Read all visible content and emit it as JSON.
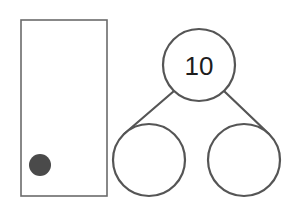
{
  "page": {
    "background_color": "#ffffff",
    "width": 300,
    "height": 211
  },
  "colors": {
    "rect_stroke": "#6b6b6b",
    "circle_stroke": "#555555",
    "dot_fill": "#4a4a4a",
    "text_fill": "#1d1d1d",
    "fill_white": "#ffffff"
  },
  "counter_frame": {
    "label": "counter-frame",
    "x": 21,
    "y": 20,
    "width": 86,
    "height": 176,
    "dots": [
      {
        "label": "counter-dot-1",
        "cx": 40,
        "cy": 165,
        "r": 11
      }
    ],
    "dot_count": "1"
  },
  "number_bond": {
    "label": "number-bond",
    "whole": {
      "label": "whole-circle",
      "value": "10",
      "cx": 199,
      "cy": 65,
      "r": 36
    },
    "parts": [
      {
        "label": "part-circle-left",
        "value": "",
        "cx": 149,
        "cy": 160,
        "r": 36
      },
      {
        "label": "part-circle-right",
        "value": "",
        "cx": 244,
        "cy": 160,
        "r": 36
      }
    ],
    "links": [
      {
        "label": "link-left",
        "x1": 174,
        "y1": 91,
        "x2": 124,
        "y2": 134
      },
      {
        "label": "link-right",
        "x1": 224,
        "y1": 91,
        "x2": 269,
        "y2": 134
      }
    ]
  }
}
